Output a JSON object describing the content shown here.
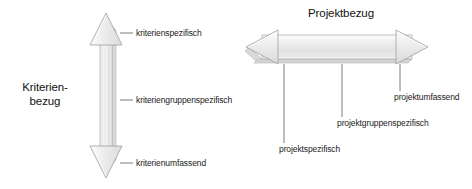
{
  "diagram": {
    "background_color": "#ffffff",
    "arrow_fill_light": "#fbfbfb",
    "arrow_fill_mid": "#e9e9e9",
    "arrow_fill_dark": "#d2d2d2",
    "arrow_outline_color": "#9a9a9a",
    "leader_line_color": "#6d6d6d",
    "text_color": "#1a1a1a"
  },
  "axes": {
    "vertical": {
      "title": "Kriterien-\nbezug",
      "title_line1": "Kriterien-",
      "title_line2": "bezug",
      "orientation": "vertical",
      "arrowheads": "double",
      "ticks": [
        {
          "label": "kriterienspezifisch",
          "position": "top"
        },
        {
          "label": "kriteriengruppenspezifisch",
          "position": "middle"
        },
        {
          "label": "kriterienumfassend",
          "position": "bottom"
        }
      ]
    },
    "horizontal": {
      "title": "Projektbezug",
      "orientation": "horizontal",
      "arrowheads": "double",
      "ticks": [
        {
          "label": "projektspezifisch",
          "position": "left"
        },
        {
          "label": "projektgruppenspezifisch",
          "position": "center"
        },
        {
          "label": "projektumfassend",
          "position": "right"
        }
      ]
    }
  }
}
